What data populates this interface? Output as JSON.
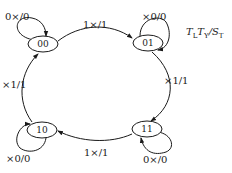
{
  "legend": {
    "t1_main": "T",
    "t1_sub": "L",
    "t2_main": "T",
    "t2_sub": "Y",
    "sep": "/",
    "s_main": "S",
    "s_sub": "T"
  },
  "nodes": [
    {
      "id": "00",
      "label": "00"
    },
    {
      "id": "01",
      "label": "01"
    },
    {
      "id": "10",
      "label": "10"
    },
    {
      "id": "11",
      "label": "11"
    }
  ],
  "edges": {
    "self_00": "0×/0",
    "e_00_01": "1×/1",
    "self_01": "×0/0",
    "e_01_11": "×1/1",
    "self_11": "0×/0",
    "e_11_10": "1×/1",
    "self_10": "×0/0",
    "e_10_00": "×1/1"
  },
  "colors": {
    "stroke": "#1a1a1a",
    "background": "#ffffff"
  }
}
